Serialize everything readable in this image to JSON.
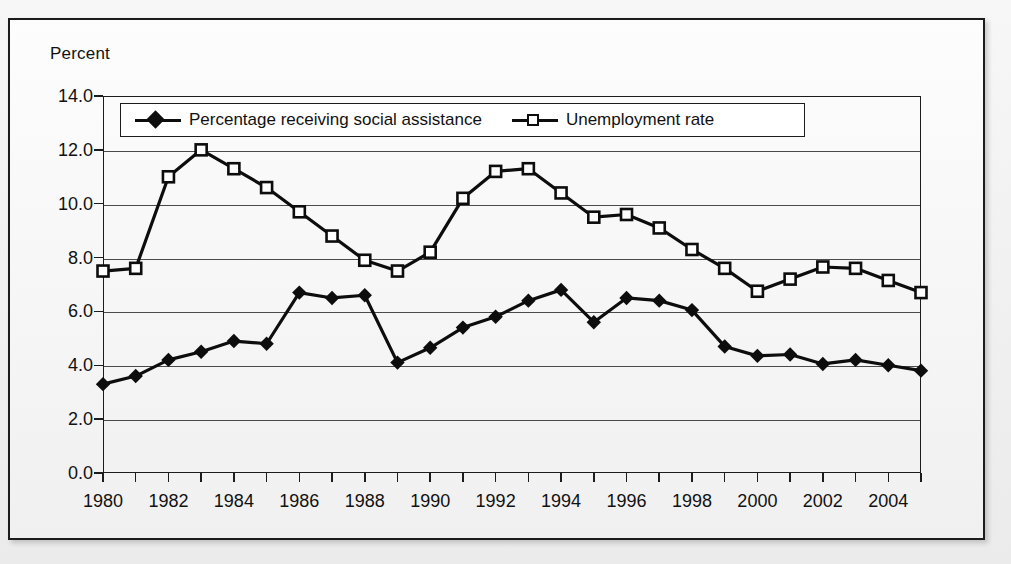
{
  "figure": {
    "axis_title": "Percent"
  },
  "legend": {
    "entries": [
      {
        "label": "Percentage receiving social assistance",
        "marker": "filled-diamond",
        "color": "#0d0d0d"
      },
      {
        "label": "Unemployment rate",
        "marker": "open-square",
        "color": "#0d0d0d"
      }
    ]
  },
  "chart_data": {
    "type": "line",
    "title": "",
    "subtitle": "",
    "xlabel": "",
    "ylabel": "Percent",
    "ylim": [
      0.0,
      14.0
    ],
    "ytick_labels": [
      "0.0",
      "2.0",
      "4.0",
      "6.0",
      "8.0",
      "10.0",
      "12.0",
      "14.0"
    ],
    "yticks": [
      0.0,
      2.0,
      4.0,
      6.0,
      8.0,
      10.0,
      12.0,
      14.0
    ],
    "grid": true,
    "legend_position": "top-center-inside",
    "x": [
      1980,
      1981,
      1982,
      1983,
      1984,
      1985,
      1986,
      1987,
      1988,
      1989,
      1990,
      1991,
      1992,
      1993,
      1994,
      1995,
      1996,
      1997,
      1998,
      1999,
      2000,
      2001,
      2002,
      2003,
      2004,
      2005
    ],
    "xlim": [
      1980,
      2005
    ],
    "xtick_labels": [
      "1980",
      "1982",
      "1984",
      "1986",
      "1988",
      "1990",
      "1992",
      "1994",
      "1996",
      "1998",
      "2000",
      "2002",
      "2004"
    ],
    "xticks_labeled": [
      1980,
      1982,
      1984,
      1986,
      1988,
      1990,
      1992,
      1994,
      1996,
      1998,
      2000,
      2002,
      2004
    ],
    "xticks_minor": [
      1981,
      1983,
      1985,
      1987,
      1989,
      1991,
      1993,
      1995,
      1997,
      1999,
      2001,
      2003,
      2005
    ],
    "series": [
      {
        "name": "Percentage receiving social assistance",
        "marker": "filled-diamond",
        "color": "#0d0d0d",
        "values": [
          3.3,
          3.6,
          4.2,
          4.5,
          4.9,
          4.8,
          6.7,
          6.5,
          6.6,
          4.1,
          4.65,
          5.4,
          5.8,
          6.4,
          6.8,
          5.6,
          6.5,
          6.4,
          6.05,
          4.7,
          4.35,
          4.4,
          4.05,
          4.2,
          4.0,
          3.8
        ]
      },
      {
        "name": "Unemployment rate",
        "marker": "open-square",
        "color": "#0d0d0d",
        "values": [
          7.5,
          7.6,
          11.0,
          12.0,
          11.3,
          10.6,
          9.7,
          8.8,
          7.9,
          7.5,
          8.2,
          10.2,
          11.2,
          11.3,
          10.4,
          9.5,
          9.6,
          9.1,
          8.3,
          7.6,
          6.75,
          7.2,
          7.65,
          7.6,
          7.15,
          6.7
        ]
      }
    ]
  }
}
